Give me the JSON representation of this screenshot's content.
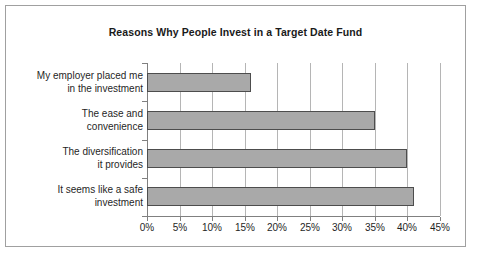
{
  "chart_data": {
    "type": "bar",
    "orientation": "horizontal",
    "title": "Reasons Why People Invest in a Target Date Fund",
    "xlabel": "",
    "ylabel": "",
    "categories": [
      "It seems like a safe investment",
      "The diversification it provides",
      "The ease and convenience",
      "My employer placed me in the investment"
    ],
    "category_lines": [
      [
        "It seems like a safe",
        "investment"
      ],
      [
        "The diversification",
        "it provides"
      ],
      [
        "The ease and",
        "convenience"
      ],
      [
        "My employer placed me",
        "in the investment"
      ]
    ],
    "values": [
      41,
      40,
      35,
      16
    ],
    "value_labels": [
      "41%",
      "40%",
      "35%",
      "16%"
    ],
    "xlim": [
      0,
      45
    ],
    "xticks": [
      0,
      5,
      10,
      15,
      20,
      25,
      30,
      35,
      40,
      45
    ],
    "xtick_labels": [
      "0%",
      "5%",
      "10%",
      "15%",
      "20%",
      "25%",
      "30%",
      "35%",
      "40%",
      "45%"
    ],
    "grid": "vertical",
    "legend": "none",
    "colors": {
      "bar_fill": "#a9a9a9",
      "bar_border": "#4d4d4d",
      "gridline": "#b5b5b5",
      "axis": "#808080",
      "frame_border": "#a0a0a0",
      "text": "#1f1f1f",
      "title_text": "#1a1a1a",
      "background": "#ffffff"
    }
  }
}
